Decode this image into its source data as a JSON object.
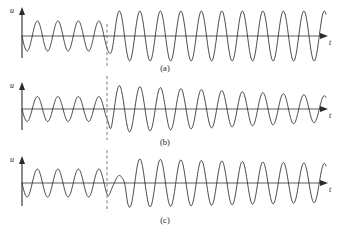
{
  "figure": {
    "title": "",
    "background": "#ffffff",
    "stroke_color": "#2b2b2b",
    "axis_color": "#4a4a4a",
    "marker_color": "#6b6b6b",
    "width": 339,
    "height": 228
  },
  "panels": [
    {
      "id": "a",
      "caption": "(a)",
      "caption_x": 165,
      "caption_y": 70,
      "y_axis_label": "u",
      "x_axis_label": "t"
    },
    {
      "id": "b",
      "caption": "(b)",
      "caption_x": 165,
      "caption_y": 68,
      "y_axis_label": "u",
      "x_axis_label": "t"
    },
    {
      "id": "c",
      "caption": "(c)",
      "caption_x": 165,
      "caption_y": 72,
      "y_axis_label": "u",
      "x_axis_label": "t"
    }
  ],
  "marker": {
    "name": "event-time-marker",
    "x": 107,
    "label": ""
  },
  "chart_data": [
    {
      "type": "line",
      "id": "a",
      "title": "(a)",
      "xlabel": "t",
      "ylabel": "u",
      "grid": false,
      "legend": "none",
      "axis": {
        "origin_x": 22,
        "baseline_y": 36,
        "x_start": 22,
        "x_end": 326,
        "y_top": 10,
        "amplitude_scale": 26
      },
      "description": "Sinusoidal signal; moderate amplitude before marker, larger steady amplitude after marker.",
      "waveform": {
        "period_px": 20.5,
        "phase_deg": 180,
        "segments": [
          {
            "x_from": 22,
            "x_to": 107,
            "amplitude": 0.58
          },
          {
            "x_from": 107,
            "x_to": 326,
            "amplitude": 0.96
          }
        ],
        "transition_px": 8
      },
      "x": [
        22,
        107,
        326
      ],
      "values": [
        0.58,
        0.58,
        0.96
      ]
    },
    {
      "type": "line",
      "id": "b",
      "title": "(b)",
      "xlabel": "t",
      "ylabel": "u",
      "grid": false,
      "legend": "none",
      "axis": {
        "origin_x": 22,
        "baseline_y": 33,
        "x_start": 22,
        "x_end": 326,
        "y_top": 8,
        "amplitude_scale": 24
      },
      "description": "Sinusoidal signal; small amplitude before marker, abrupt jump to maximum at marker then slow decay toward the right.",
      "waveform": {
        "period_px": 20.5,
        "phase_deg": 180,
        "segments": [
          {
            "x_from": 22,
            "x_to": 107,
            "amplitude": 0.52
          },
          {
            "x_from": 107,
            "x_to": 326,
            "amplitude": 1.0,
            "decay_to": 0.55
          }
        ],
        "transition_px": 5
      },
      "x": [
        22,
        107,
        170,
        240,
        326
      ],
      "values": [
        0.52,
        1.0,
        0.85,
        0.7,
        0.55
      ]
    },
    {
      "type": "line",
      "id": "c",
      "title": "(c)",
      "xlabel": "t",
      "ylabel": "u",
      "grid": false,
      "legend": "none",
      "axis": {
        "origin_x": 22,
        "baseline_y": 33,
        "x_start": 22,
        "x_end": 326,
        "y_top": 8,
        "amplitude_scale": 25
      },
      "description": "Sinusoidal signal; moderate amplitude before marker, a small shoulder bump right after the marker, then large amplitude oscillation with slight decay at the far right.",
      "waveform": {
        "period_px": 20.5,
        "phase_deg": 180,
        "segments": [
          {
            "x_from": 22,
            "x_to": 107,
            "amplitude": 0.56
          },
          {
            "x_from": 107,
            "x_to": 122,
            "amplitude": 0.3
          },
          {
            "x_from": 122,
            "x_to": 326,
            "amplitude": 0.98,
            "decay_to": 0.78
          }
        ],
        "transition_px": 6
      },
      "x": [
        22,
        107,
        122,
        300,
        326
      ],
      "values": [
        0.56,
        0.3,
        0.98,
        0.95,
        0.78
      ]
    }
  ]
}
